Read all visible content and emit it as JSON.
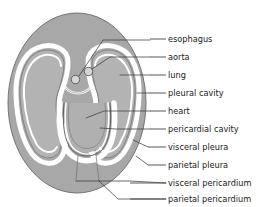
{
  "diagram": {
    "colors": {
      "body_wall": "#a8a8a8",
      "lung": "#b3b3b3",
      "cavity_white": "#ffffff",
      "heart": "#b0b0b0",
      "outline": "#5a5a5a",
      "leader_line": "#3c3c3c",
      "background": "#ffffff",
      "text": "#1a1a1a"
    },
    "labels": [
      {
        "id": "esophagus",
        "text": "esophagus",
        "text_x": 168,
        "text_y": 39,
        "dash_x1": 150,
        "dash_x2": 166
      },
      {
        "id": "aorta",
        "text": "aorta",
        "text_x": 168,
        "text_y": 57,
        "dash_x1": 150,
        "dash_x2": 166
      },
      {
        "id": "lung",
        "text": "lung",
        "text_x": 168,
        "text_y": 75,
        "dash_x1": 150,
        "dash_x2": 166
      },
      {
        "id": "pleural-cavity",
        "text": "pleural cavity",
        "text_x": 168,
        "text_y": 93,
        "dash_x1": 150,
        "dash_x2": 166
      },
      {
        "id": "heart",
        "text": "heart",
        "text_x": 168,
        "text_y": 111,
        "dash_x1": 150,
        "dash_x2": 166
      },
      {
        "id": "pericardial-cavity",
        "text": "pericardial cavity",
        "text_x": 168,
        "text_y": 129,
        "dash_x1": 150,
        "dash_x2": 166
      },
      {
        "id": "visceral-pleura",
        "text": "visceral pleura",
        "text_x": 168,
        "text_y": 147,
        "dash_x1": 148,
        "dash_x2": 166
      },
      {
        "id": "parietal-pleura",
        "text": "parietal pleura",
        "text_x": 168,
        "text_y": 165,
        "dash_x1": 148,
        "dash_x2": 166
      },
      {
        "id": "visceral-pericardium",
        "text": "visceral pericardium",
        "text_x": 168,
        "text_y": 183,
        "dash_x1": 130,
        "dash_x2": 166
      },
      {
        "id": "parietal-pericardium",
        "text": "parietal pericardium",
        "text_x": 168,
        "text_y": 199,
        "dash_x1": 130,
        "dash_x2": 166
      }
    ],
    "structures": {
      "esophagus_label": "esophagus",
      "aorta_label": "aorta",
      "left_lung_label": "lung",
      "right_lung_label": "lung",
      "heart_label": "heart"
    }
  }
}
